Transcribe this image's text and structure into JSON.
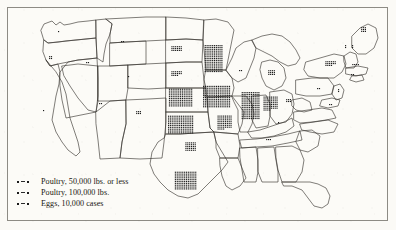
{
  "figure": {
    "kind": "dot-density-map",
    "region": "United States",
    "background_color": "#fbfaf6",
    "ink_color": "#1b1b1b",
    "border_color": "#8d8b84"
  },
  "legend": {
    "name": "map-legend",
    "entries": [
      {
        "symbol": "dot-dash-dot",
        "label": "Poultry, 50,000 lbs. or less"
      },
      {
        "symbol": "dot-dash-dot",
        "label": "Poultry, 100,000 lbs."
      },
      {
        "symbol": "dot-dash-dot",
        "label": "Eggs, 10,000 cases"
      }
    ]
  },
  "chart_data": {
    "type": "scatter",
    "title": "",
    "xlabel": "",
    "ylabel": "",
    "legend_entries": [
      "Poultry, 50,000 lbs. or less",
      "Poultry, 100,000 lbs.",
      "Eggs, 10,000 cases"
    ],
    "state_density": [
      {
        "state": "Washington",
        "cx": 58,
        "cy": 31,
        "dots": 1,
        "cols": 1,
        "rows": 1
      },
      {
        "state": "Oregon",
        "cx": 50,
        "cy": 57,
        "dots": 4,
        "cols": 2,
        "rows": 2
      },
      {
        "state": "Idaho",
        "cx": 87,
        "cy": 62,
        "dots": 2,
        "cols": 2,
        "rows": 1
      },
      {
        "state": "Montana",
        "cx": 122,
        "cy": 41,
        "dots": 2,
        "cols": 2,
        "rows": 1
      },
      {
        "state": "Wyoming",
        "cx": 128,
        "cy": 76,
        "dots": 1,
        "cols": 1,
        "rows": 1
      },
      {
        "state": "California",
        "cx": 43,
        "cy": 110,
        "dots": 1,
        "cols": 1,
        "rows": 1
      },
      {
        "state": "Nevada",
        "cx": 70,
        "cy": 100,
        "dots": 0,
        "cols": 0,
        "rows": 0
      },
      {
        "state": "Utah",
        "cx": 100,
        "cy": 103,
        "dots": 2,
        "cols": 2,
        "rows": 1
      },
      {
        "state": "Colorado",
        "cx": 138,
        "cy": 112,
        "dots": 6,
        "cols": 3,
        "rows": 2
      },
      {
        "state": "Arizona",
        "cx": 83,
        "cy": 143,
        "dots": 0,
        "cols": 0,
        "rows": 0
      },
      {
        "state": "New Mexico",
        "cx": 120,
        "cy": 145,
        "dots": 0,
        "cols": 0,
        "rows": 0
      },
      {
        "state": "North Dakota",
        "cx": 176,
        "cy": 48,
        "dots": 18,
        "cols": 6,
        "rows": 3
      },
      {
        "state": "South Dakota",
        "cx": 176,
        "cy": 73,
        "dots": 16,
        "cols": 6,
        "rows": 3
      },
      {
        "state": "Nebraska",
        "cx": 180,
        "cy": 97,
        "dots": 130,
        "cols": 13,
        "rows": 10
      },
      {
        "state": "Kansas",
        "cx": 180,
        "cy": 124,
        "dots": 140,
        "cols": 14,
        "rows": 10
      },
      {
        "state": "Oklahoma",
        "cx": 190,
        "cy": 146,
        "dots": 30,
        "cols": 6,
        "rows": 5
      },
      {
        "state": "Texas",
        "cx": 185,
        "cy": 180,
        "dots": 120,
        "cols": 12,
        "rows": 10
      },
      {
        "state": "Minnesota",
        "cx": 213,
        "cy": 58,
        "dots": 150,
        "cols": 10,
        "rows": 15
      },
      {
        "state": "Iowa",
        "cx": 216,
        "cy": 96,
        "dots": 180,
        "cols": 15,
        "rows": 12
      },
      {
        "state": "Missouri",
        "cx": 224,
        "cy": 122,
        "dots": 60,
        "cols": 8,
        "rows": 8
      },
      {
        "state": "Arkansas",
        "cx": 226,
        "cy": 146,
        "dots": 0,
        "cols": 0,
        "rows": 0
      },
      {
        "state": "Wisconsin",
        "cx": 240,
        "cy": 70,
        "dots": 2,
        "cols": 2,
        "rows": 1
      },
      {
        "state": "Illinois",
        "cx": 250,
        "cy": 105,
        "dots": 150,
        "cols": 10,
        "rows": 15
      },
      {
        "state": "Indiana",
        "cx": 270,
        "cy": 103,
        "dots": 60,
        "cols": 8,
        "rows": 8
      },
      {
        "state": "Michigan",
        "cx": 271,
        "cy": 72,
        "dots": 12,
        "cols": 4,
        "rows": 3
      },
      {
        "state": "Ohio",
        "cx": 288,
        "cy": 100,
        "dots": 6,
        "cols": 3,
        "rows": 2
      },
      {
        "state": "Kentucky",
        "cx": 278,
        "cy": 122,
        "dots": 1,
        "cols": 1,
        "rows": 1
      },
      {
        "state": "Tennessee",
        "cx": 268,
        "cy": 139,
        "dots": 3,
        "cols": 3,
        "rows": 1
      },
      {
        "state": "Mississippi",
        "cx": 248,
        "cy": 160,
        "dots": 0,
        "cols": 0,
        "rows": 0
      },
      {
        "state": "Alabama",
        "cx": 266,
        "cy": 162,
        "dots": 0,
        "cols": 0,
        "rows": 0
      },
      {
        "state": "Georgia",
        "cx": 290,
        "cy": 160,
        "dots": 0,
        "cols": 0,
        "rows": 0
      },
      {
        "state": "Florida",
        "cx": 310,
        "cy": 196,
        "dots": 0,
        "cols": 0,
        "rows": 0
      },
      {
        "state": "South Carolina",
        "cx": 305,
        "cy": 148,
        "dots": 0,
        "cols": 0,
        "rows": 0
      },
      {
        "state": "North Carolina",
        "cx": 312,
        "cy": 134,
        "dots": 0,
        "cols": 0,
        "rows": 0
      },
      {
        "state": "Virginia",
        "cx": 312,
        "cy": 118,
        "dots": 0,
        "cols": 0,
        "rows": 0
      },
      {
        "state": "Pennsylvania",
        "cx": 318,
        "cy": 88,
        "dots": 2,
        "cols": 2,
        "rows": 1
      },
      {
        "state": "New York",
        "cx": 330,
        "cy": 63,
        "dots": 16,
        "cols": 6,
        "rows": 3
      },
      {
        "state": "New Jersey",
        "cx": 338,
        "cy": 90,
        "dots": 2,
        "cols": 1,
        "rows": 2
      },
      {
        "state": "Maryland",
        "cx": 330,
        "cy": 104,
        "dots": 2,
        "cols": 2,
        "rows": 1
      },
      {
        "state": "Massachusetts",
        "cx": 355,
        "cy": 64,
        "dots": 4,
        "cols": 4,
        "rows": 1
      },
      {
        "state": "Vermont",
        "cx": 345,
        "cy": 46,
        "dots": 2,
        "cols": 1,
        "rows": 2
      },
      {
        "state": "New Hampshire",
        "cx": 352,
        "cy": 46,
        "dots": 2,
        "cols": 1,
        "rows": 2
      },
      {
        "state": "Maine",
        "cx": 363,
        "cy": 29,
        "dots": 9,
        "cols": 3,
        "rows": 3
      },
      {
        "state": "Connecticut",
        "cx": 352,
        "cy": 74,
        "dots": 2,
        "cols": 2,
        "rows": 1
      }
    ]
  }
}
